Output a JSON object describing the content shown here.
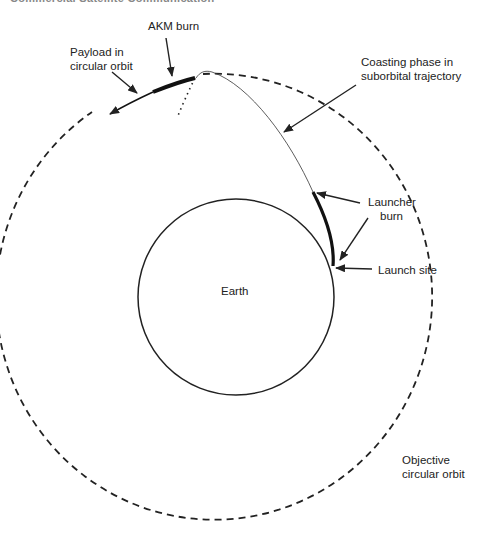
{
  "header": {
    "cropped_text": "Commercial Satellite Communication"
  },
  "labels": {
    "akm_burn": "AKM burn",
    "payload_line1": "Payload in",
    "payload_line2": "circular orbit",
    "coasting_line1": "Coasting phase in",
    "coasting_line2": "suborbital trajectory",
    "launcher_line1": "Launcher",
    "launcher_line2": "burn",
    "launch_site": "Launch site",
    "earth": "Earth",
    "objective_line1": "Objective",
    "objective_line2": "circular orbit"
  },
  "colors": {
    "stroke": "#222222",
    "background": "#ffffff"
  }
}
